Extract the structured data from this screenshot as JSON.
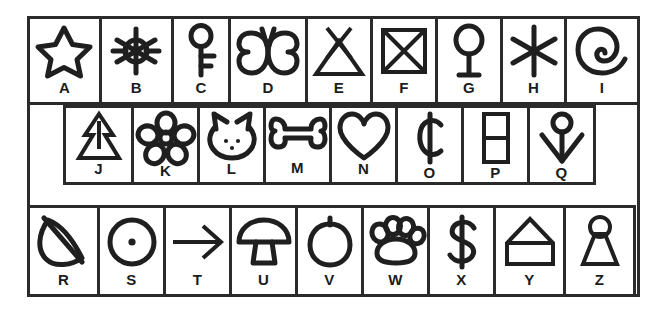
{
  "figure": {
    "type": "legend-key-grid",
    "title": "",
    "background_color": "#ffffff",
    "line_color": "#1f1f1f",
    "letter_color": "#1c1c1c",
    "total_cells": 26
  },
  "rows": [
    {
      "row_index": 1,
      "cell_count": 9,
      "cells": [
        {
          "letter": "A",
          "icon": "star-icon",
          "icon_label": "star"
        },
        {
          "letter": "B",
          "icon": "sun-icon",
          "icon_label": "sun with rays"
        },
        {
          "letter": "C",
          "icon": "key-icon",
          "icon_label": "key"
        },
        {
          "letter": "D",
          "icon": "butterfly-icon",
          "icon_label": "butterfly"
        },
        {
          "letter": "E",
          "icon": "teepee-icon",
          "icon_label": "triangle with crossed top"
        },
        {
          "letter": "F",
          "icon": "crossed-box-icon",
          "icon_label": "square with diagonal cross"
        },
        {
          "letter": "G",
          "icon": "balloon-icon",
          "icon_label": "circle on stem"
        },
        {
          "letter": "H",
          "icon": "asterisk-icon",
          "icon_label": "six-pointed asterisk"
        },
        {
          "letter": "I",
          "icon": "spiral-icon",
          "icon_label": "spiral"
        }
      ]
    },
    {
      "row_index": 2,
      "cell_count": 8,
      "cells": [
        {
          "letter": "J",
          "icon": "pine-tree-icon",
          "icon_label": "pine tree"
        },
        {
          "letter": "K",
          "icon": "flower-icon",
          "icon_label": "five-petal flower"
        },
        {
          "letter": "L",
          "icon": "cat-face-icon",
          "icon_label": "cat face"
        },
        {
          "letter": "M",
          "icon": "bone-icon",
          "icon_label": "bone"
        },
        {
          "letter": "N",
          "icon": "heart-icon",
          "icon_label": "heart"
        },
        {
          "letter": "O",
          "icon": "cent-sign-icon",
          "icon_label": "cent sign"
        },
        {
          "letter": "P",
          "icon": "divided-rectangle-icon",
          "icon_label": "rectangle split in two"
        },
        {
          "letter": "Q",
          "icon": "anchor-arrow-icon",
          "icon_label": "downward arrow with circle head"
        }
      ]
    },
    {
      "row_index": 3,
      "cell_count": 9,
      "cells": [
        {
          "letter": "R",
          "icon": "leaf-icon",
          "icon_label": "leaf"
        },
        {
          "letter": "S",
          "icon": "dotted-circle-icon",
          "icon_label": "circle with center dot"
        },
        {
          "letter": "T",
          "icon": "arrow-right-icon",
          "icon_label": "right arrow"
        },
        {
          "letter": "U",
          "icon": "mushroom-icon",
          "icon_label": "mushroom"
        },
        {
          "letter": "V",
          "icon": "apple-icon",
          "icon_label": "apple"
        },
        {
          "letter": "W",
          "icon": "paw-print-icon",
          "icon_label": "paw print"
        },
        {
          "letter": "X",
          "icon": "dollar-sign-icon",
          "icon_label": "dollar sign"
        },
        {
          "letter": "Y",
          "icon": "house-icon",
          "icon_label": "house"
        },
        {
          "letter": "Z",
          "icon": "keyhole-icon",
          "icon_label": "keyhole"
        }
      ]
    }
  ]
}
